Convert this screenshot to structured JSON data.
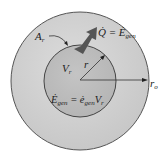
{
  "diagram": {
    "labels": {
      "area": "A",
      "area_sub": "r",
      "heat": "Q̇ = Ė",
      "heat_sub": "gen",
      "volume": "V",
      "volume_sub": "r",
      "radius": "r",
      "outer_radius": "r",
      "outer_radius_sub": "o",
      "egen_lhs": "Ė",
      "egen_lhs_sub": "gen",
      "egen_eq": " = ė",
      "egen_rhs_sub": "gen",
      "egen_rhs": "V",
      "egen_rhs_sub2": "r"
    },
    "colors": {
      "outer_fill": "#d2d2d2",
      "inner_fill": "#bcbcbc",
      "stroke": "#444444",
      "arrow": "#555555"
    }
  }
}
